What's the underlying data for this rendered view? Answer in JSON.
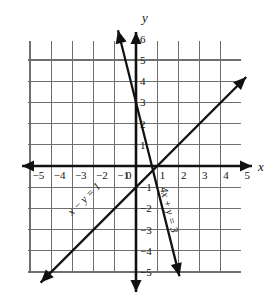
{
  "chart_data": {
    "type": "line",
    "title": "",
    "subtitle": "",
    "xlabel": "x",
    "ylabel": "y",
    "xlim": [
      -5.8,
      5.8
    ],
    "ylim": [
      -5.5,
      6.8
    ],
    "grid": true,
    "legend": "none",
    "grid_step": 1,
    "x_ticks": [
      -5,
      -4,
      -3,
      -2,
      -1,
      0,
      1,
      2,
      3,
      4,
      5
    ],
    "y_ticks": [
      6,
      5,
      4,
      3,
      2,
      1,
      -1,
      -2,
      -3,
      -4,
      -5
    ],
    "x_tick_labels": [
      "-5",
      "-4",
      "-3",
      "-2",
      "-1",
      "0",
      "1",
      "2",
      "3",
      "4",
      "5"
    ],
    "y_tick_labels": [
      "6",
      "5",
      "4",
      "3",
      "2",
      "1",
      "-1",
      "-2",
      "-3",
      "-4",
      "-5"
    ],
    "series": [
      {
        "name": "x - y = 1",
        "label": "x - y = 1",
        "equation": "x − y = 1",
        "slope": 1,
        "intercept": -1,
        "points": [
          [
            -4.5,
            -5.5
          ],
          [
            5.2,
            4.2
          ]
        ],
        "color": "#111111",
        "arrows": "both"
      },
      {
        "name": "4x + y = 3",
        "label": "4x + y = 3",
        "equation": "4x + y = 3",
        "slope": -4,
        "intercept": 3,
        "points": [
          [
            -0.85,
            6.4
          ],
          [
            2.05,
            -5.2
          ]
        ],
        "color": "#111111",
        "arrows": "both"
      }
    ],
    "intersection": [
      0.8,
      -0.2
    ]
  },
  "axes": {
    "x_letter": "x",
    "y_letter": "y",
    "origin_label": "0"
  },
  "colors": {
    "grid": "#6f6f6f",
    "axis": "#111111",
    "line": "#111111",
    "background": "#ffffff",
    "text": "#111111"
  }
}
